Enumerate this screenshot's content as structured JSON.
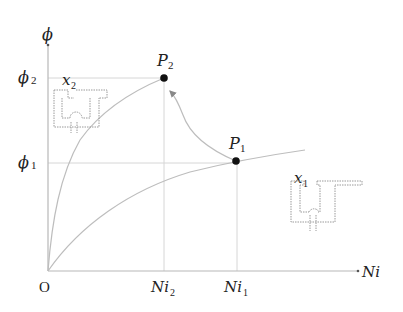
{
  "figure": {
    "type": "magnetization curve diagram",
    "axes": {
      "y_label": "ϕ",
      "x_label": "Ni",
      "origin_label": "O"
    },
    "y_ticks": [
      {
        "label": "ϕ",
        "sub": "2",
        "name": "phi2"
      },
      {
        "label": "ϕ",
        "sub": "1",
        "name": "phi1"
      }
    ],
    "x_ticks": [
      {
        "label": "Ni",
        "sub": "2",
        "name": "Ni2"
      },
      {
        "label": "Ni",
        "sub": "1",
        "name": "Ni1"
      }
    ],
    "points": [
      {
        "label": "P",
        "sub": "2",
        "x_ref": "Ni2",
        "y_ref": "phi2"
      },
      {
        "label": "P",
        "sub": "1",
        "x_ref": "Ni1",
        "y_ref": "phi1"
      }
    ],
    "curves": [
      {
        "name": "curve-x2",
        "description": "steep curve for smaller air gap x2 through P2"
      },
      {
        "name": "curve-x1",
        "description": "shallow curve for larger air gap x1 through P1"
      },
      {
        "name": "transition",
        "description": "arrowed path from P1 to P2"
      }
    ],
    "schematics": [
      {
        "label": "x",
        "sub": "2",
        "description": "magnet with closed (small) gap"
      },
      {
        "label": "x",
        "sub": "1",
        "description": "magnet with open (large) gap"
      }
    ]
  }
}
